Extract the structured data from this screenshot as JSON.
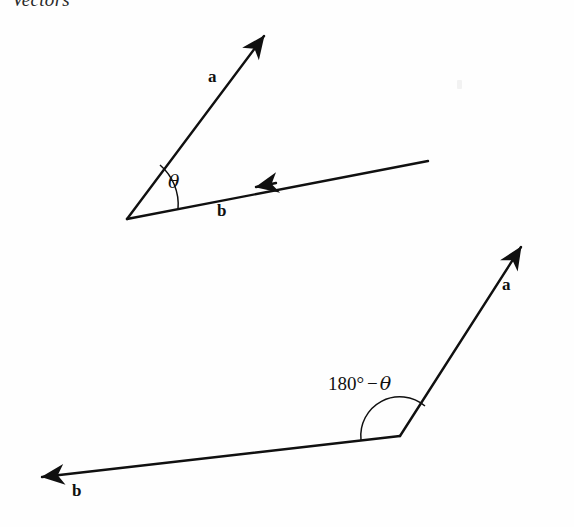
{
  "page": {
    "running_head": "Vectors",
    "background_color": "#fefefe",
    "ink_color": "#101010",
    "width": 574,
    "height": 527
  },
  "figures": [
    {
      "id": "acute-angle-figure",
      "description": "Two vectors a and b drawn tail-to-tail from a common point, enclosing the acute angle theta",
      "angle_label": "θ",
      "angle_label_plain": "theta",
      "vertex": {
        "x": 127,
        "y": 219
      },
      "vectors": [
        {
          "name": "a",
          "label": "a",
          "label_pos": {
            "x": 208,
            "y": 68
          },
          "from": {
            "x": 127,
            "y": 219
          },
          "to": {
            "x": 270,
            "y": 28
          },
          "arrow_at": "head",
          "direction": "up-right"
        },
        {
          "name": "b",
          "label": "b",
          "label_pos": {
            "x": 217,
            "y": 202
          },
          "from": {
            "x": 428,
            "y": 161
          },
          "to": {
            "x": 127,
            "y": 219
          },
          "arrow_at": "mid",
          "arrow_pos": {
            "x": 258,
            "y": 186
          },
          "direction": "down-left"
        }
      ],
      "arc": {
        "radius": 52,
        "start": {
          "x": 178,
          "y": 209
        },
        "end": {
          "x": 161,
          "y": 166
        },
        "label_pos": {
          "x": 168,
          "y": 172
        }
      }
    },
    {
      "id": "obtuse-angle-figure",
      "description": "The same vectors redrawn head-to-tail so the enclosed angle is the supplement, 180 degrees minus theta",
      "angle_label": "180° − θ",
      "angle_label_degrees": "180°",
      "angle_label_minus": "−",
      "angle_label_greek": "θ",
      "vertex": {
        "x": 400,
        "y": 436
      },
      "vectors": [
        {
          "name": "a",
          "label": "a",
          "label_pos": {
            "x": 502,
            "y": 276
          },
          "from": {
            "x": 400,
            "y": 436
          },
          "to": {
            "x": 527,
            "y": 238
          },
          "arrow_at": "head",
          "direction": "up-right"
        },
        {
          "name": "b",
          "label": "b",
          "label_pos": {
            "x": 72,
            "y": 482
          },
          "from": {
            "x": 400,
            "y": 436
          },
          "to": {
            "x": 32,
            "y": 478
          },
          "arrow_at": "head",
          "direction": "down-left"
        }
      ],
      "arc": {
        "radius": 39,
        "start": {
          "x": 361,
          "y": 440
        },
        "end": {
          "x": 424,
          "y": 405
        },
        "label_pos": {
          "x": 328,
          "y": 374
        }
      }
    }
  ]
}
